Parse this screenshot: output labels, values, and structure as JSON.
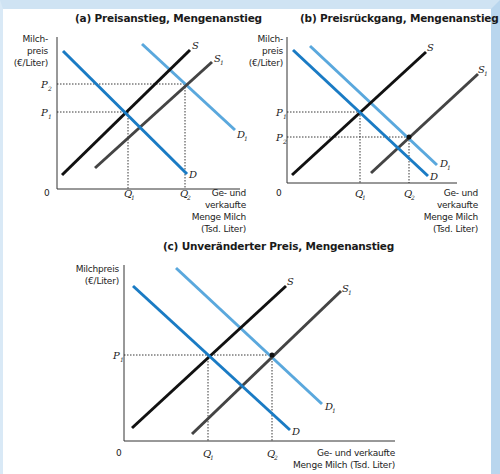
{
  "colors": {
    "demand": "#1a7bc4",
    "demand_shifted": "#5aa8dd",
    "supply": "#111111",
    "supply_shifted": "#444444",
    "frame": "#cfe3f3"
  },
  "panels": [
    {
      "id": "a",
      "title": "(a)  Preisanstieg, Mengenanstieg",
      "y_axis_label": [
        "Milch-",
        "preis",
        "(€/Liter)"
      ],
      "x_axis_label": [
        "Ge- und",
        "verkaufte",
        "Menge Milch",
        "(Tsd. Liter)"
      ],
      "origin": "0",
      "price_labels": [
        {
          "main": "P",
          "sub": "2"
        },
        {
          "main": "P",
          "sub": "1"
        }
      ],
      "quantity_labels": [
        {
          "main": "Q",
          "sub": "1"
        },
        {
          "main": "Q",
          "sub": "2"
        }
      ],
      "curves": [
        {
          "name": "S",
          "sub": ""
        },
        {
          "name": "S",
          "sub": "1"
        },
        {
          "name": "D",
          "sub": ""
        },
        {
          "name": "D",
          "sub": "1"
        }
      ]
    },
    {
      "id": "b",
      "title": "(b)  Preisrückgang, Mengenanstieg",
      "y_axis_label": [
        "Milch-",
        "preis",
        "(€/Liter)"
      ],
      "x_axis_label": [
        "Ge- und",
        "verkaufte",
        "Menge Milch",
        "(Tsd. Liter)"
      ],
      "origin": "0",
      "price_labels": [
        {
          "main": "P",
          "sub": "1"
        },
        {
          "main": "P",
          "sub": "2"
        }
      ],
      "quantity_labels": [
        {
          "main": "Q",
          "sub": "1"
        },
        {
          "main": "Q",
          "sub": "2"
        }
      ],
      "curves": [
        {
          "name": "S",
          "sub": ""
        },
        {
          "name": "S",
          "sub": "1"
        },
        {
          "name": "D",
          "sub": ""
        },
        {
          "name": "D",
          "sub": "1"
        }
      ]
    },
    {
      "id": "c",
      "title": "(c)  Unveränderter Preis, Mengenanstieg",
      "y_axis_label": [
        "Milchpreis",
        "(€/Liter)"
      ],
      "x_axis_label": [
        "Ge- und verkaufte",
        "Menge Milch (Tsd. Liter)"
      ],
      "origin": "0",
      "price_labels": [
        {
          "main": "P",
          "sub": "1"
        }
      ],
      "quantity_labels": [
        {
          "main": "Q",
          "sub": "1"
        },
        {
          "main": "Q",
          "sub": "2"
        }
      ],
      "curves": [
        {
          "name": "S",
          "sub": ""
        },
        {
          "name": "S",
          "sub": "1"
        },
        {
          "name": "D",
          "sub": ""
        },
        {
          "name": "D",
          "sub": "1"
        }
      ]
    }
  ]
}
